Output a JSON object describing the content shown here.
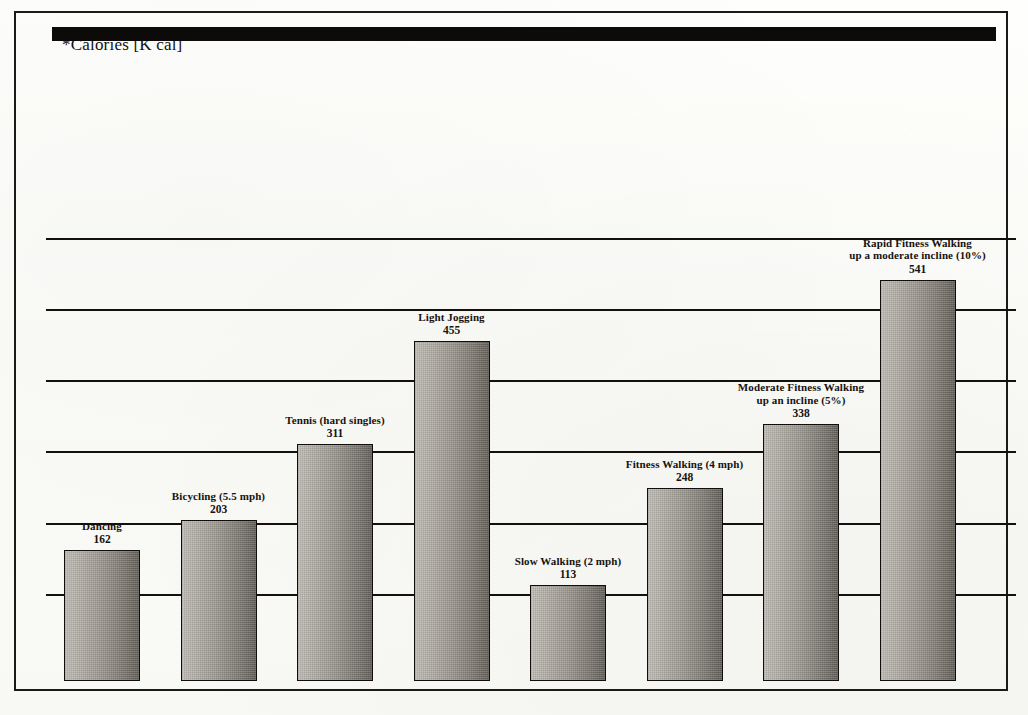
{
  "chart_data": {
    "type": "bar",
    "title": "*Calories [K cal]",
    "xlabel": "",
    "ylabel": "",
    "ylim": [
      0,
      600
    ],
    "grid": true,
    "gridlines": [
      100,
      200,
      300,
      400,
      500,
      600
    ],
    "legend": "none",
    "axis_tick_labels": [],
    "categories": [
      "Dancing",
      "Bicycling (5.5 mph)",
      "Tennis (hard singles)",
      "Light Jogging",
      "Slow Walking (2 mph)",
      "Fitness Walking (4 mph)",
      "Moderate Fitness Walking\nup an incline (5%)",
      "Rapid Fitness Walking\nup a moderate incline (10%)"
    ],
    "values": [
      162,
      203,
      311,
      455,
      113,
      248,
      338,
      541
    ],
    "bars": [
      {
        "label": "Dancing",
        "value": 162,
        "value_text": "162"
      },
      {
        "label": "Bicycling (5.5 mph)",
        "value": 203,
        "value_text": "203"
      },
      {
        "label": "Tennis (hard singles)",
        "value": 311,
        "value_text": "311"
      },
      {
        "label": "Light Jogging",
        "value": 455,
        "value_text": "455"
      },
      {
        "label": "Slow Walking (2 mph)",
        "value": 113,
        "value_text": "113"
      },
      {
        "label": "Fitness Walking (4 mph)",
        "value": 248,
        "value_text": "248"
      },
      {
        "label": "Moderate Fitness Walking\nup an incline (5%)",
        "value": 338,
        "value_text": "338"
      },
      {
        "label": "Rapid Fitness Walking\nup a moderate incline (10%)",
        "value": 541,
        "value_text": "541"
      }
    ],
    "colors": {
      "bar_fill_light": "#bfbcb6",
      "bar_fill_dark": "#625e58",
      "bar_border": "#100d0c",
      "gridline": "#15100e",
      "baseline": "#0d0b0a",
      "frame": "#1a1a1a",
      "text": "#16120f",
      "page_background": "#fdfdfb"
    }
  }
}
